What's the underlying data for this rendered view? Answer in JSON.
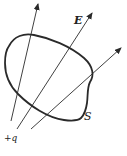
{
  "diagram": {
    "type": "gauss-law-flux",
    "labels": {
      "field": "E",
      "surface": "S",
      "charge": "+q"
    },
    "colors": {
      "stroke": "#2a2a2a",
      "text": "#222222",
      "background": "#ffffff"
    },
    "field_lines": [
      {
        "from": [
          11,
          121
        ],
        "to": [
          38,
          4
        ]
      },
      {
        "from": [
          17,
          129
        ],
        "to": [
          92,
          13
        ]
      },
      {
        "from": [
          31,
          129
        ],
        "to": [
          121,
          48
        ]
      }
    ]
  }
}
